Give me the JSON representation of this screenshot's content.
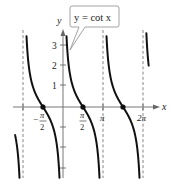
{
  "chart_data": {
    "type": "line",
    "title": "y = cot x",
    "function": "cot(x)",
    "xlabel": "x",
    "ylabel": "y",
    "x_tick_labels": [
      "-π/2",
      "π/2",
      "π",
      "2π"
    ],
    "x_ticks": [
      -3.1416,
      -1.5708,
      1.5708,
      3.1416,
      6.2832
    ],
    "y_tick_labels": [
      "1",
      "2",
      "3"
    ],
    "y_ticks": [
      -3,
      -2,
      -1,
      1,
      2,
      3
    ],
    "xlim": [
      -4.0,
      7.6
    ],
    "ylim": [
      -3.6,
      4.8
    ],
    "asymptotes_x": [
      -3.1416,
      0,
      3.1416,
      6.2832
    ],
    "asymptote_labels": [
      "-π",
      "0",
      "π",
      "2π"
    ],
    "zeros": [
      {
        "x": -1.5708,
        "y": 0,
        "label": "-π/2"
      },
      {
        "x": 1.5708,
        "y": 0,
        "label": "π/2"
      },
      {
        "x": 4.7124,
        "y": 0,
        "label": "3π/2"
      }
    ],
    "grid": false,
    "legend": "callout box near top of y-axis"
  },
  "callout": {
    "text": "y = cot x"
  },
  "axes": {
    "x_label": "x",
    "y_label": "y",
    "y_ticks": [
      "1",
      "2",
      "3"
    ],
    "x_ticks": [
      {
        "sign": "−",
        "num": "π",
        "den": "2"
      },
      {
        "sign": "",
        "num": "π",
        "den": "2"
      },
      {
        "sign": "",
        "num": "π",
        "den": ""
      },
      {
        "sign": "",
        "num": "2π",
        "den": ""
      }
    ]
  },
  "colors": {
    "curve": "#111111",
    "axis": "#555555",
    "asymptote": "#666666",
    "callout_border": "#999999"
  }
}
